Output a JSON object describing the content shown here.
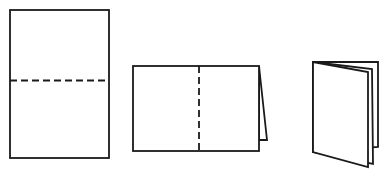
{
  "diagram": {
    "title": "",
    "steps": [
      {
        "id": "step-1",
        "label": "",
        "state": "flat sheet with horizontal fold line"
      },
      {
        "id": "step-2",
        "label": "",
        "state": "folded in half with vertical fold line"
      },
      {
        "id": "step-3",
        "label": "",
        "state": "folded booklet standing open"
      }
    ],
    "colors": {
      "stroke": "#1a1a1a",
      "paper": "#ffffff"
    }
  }
}
